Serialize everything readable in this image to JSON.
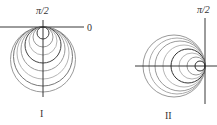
{
  "figures": [
    {
      "id": "I",
      "caption": "I",
      "axis_labels": {
        "top": "π/2",
        "right": "0"
      },
      "origin": [
        43,
        27
      ],
      "direction": "down",
      "circles": [
        {
          "diameter": 12,
          "color": "#444444"
        },
        {
          "diameter": 20,
          "color": "#9a9a9a"
        },
        {
          "diameter": 28,
          "color": "#b5b5b5"
        },
        {
          "diameter": 36,
          "color": "#444444"
        },
        {
          "diameter": 44,
          "color": "#9a9a9a"
        },
        {
          "diameter": 52,
          "color": "#b5b5b5"
        },
        {
          "diameter": 59,
          "color": "#777777"
        },
        {
          "diameter": 65,
          "color": "#9a9a9a"
        }
      ]
    },
    {
      "id": "II",
      "caption": "II",
      "axis_labels": {
        "top": "π/2"
      },
      "origin": [
        205,
        66
      ],
      "direction": "left",
      "circles": [
        {
          "diameter": 10,
          "color": "#333333"
        },
        {
          "diameter": 18,
          "color": "#9a9a9a"
        },
        {
          "diameter": 26,
          "color": "#b5b5b5"
        },
        {
          "diameter": 34,
          "color": "#333333"
        },
        {
          "diameter": 42,
          "color": "#b5b5b5"
        },
        {
          "diameter": 50,
          "color": "#9a9a9a"
        },
        {
          "diameter": 56,
          "color": "#aaaaaa"
        },
        {
          "diameter": 62,
          "color": "#999999"
        }
      ]
    }
  ]
}
